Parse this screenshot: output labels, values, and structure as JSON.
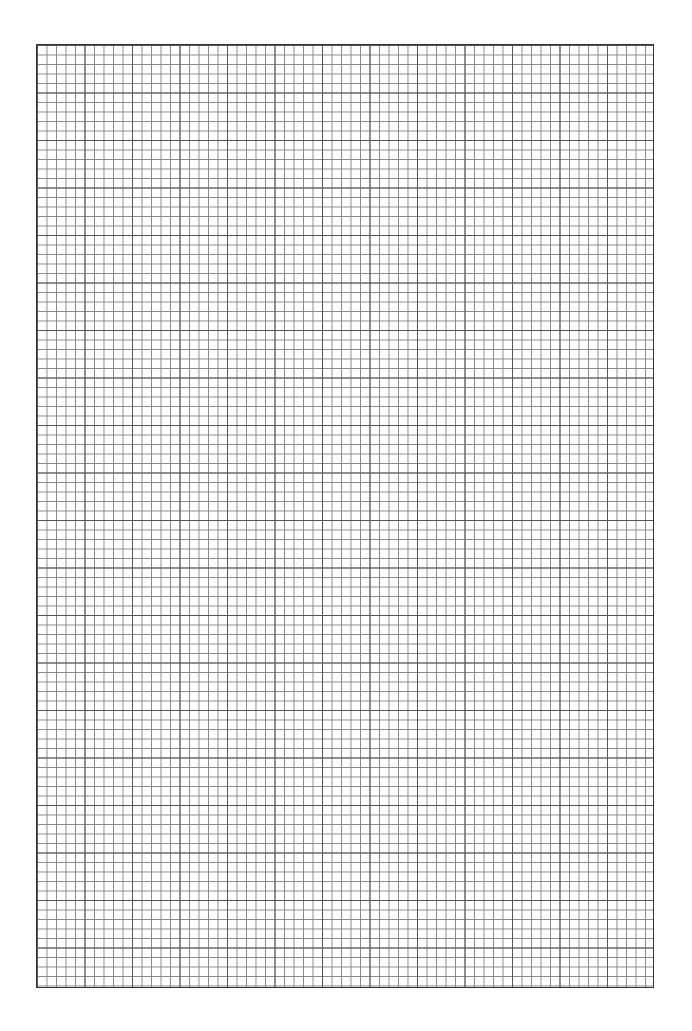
{
  "page": {
    "type": "graph-paper",
    "background_color": "#ffffff",
    "grid": {
      "line_color": "#888888",
      "major_line_color": "#555555",
      "cell_size_px": 9.5,
      "major_every": 5,
      "columns": 65,
      "rows": 99
    }
  }
}
